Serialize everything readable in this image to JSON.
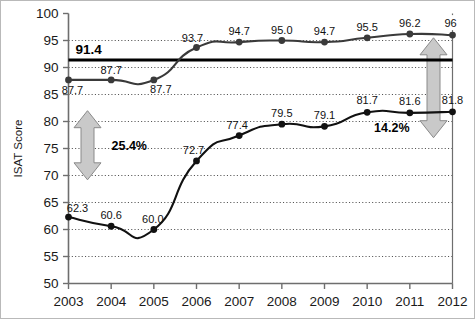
{
  "chart_data": {
    "type": "line",
    "title": "",
    "subtitle": "",
    "xlabel": "",
    "ylabel": "ISAT Score",
    "categories": [
      "2003",
      "2004",
      "2005",
      "2006",
      "2007",
      "2008",
      "2009",
      "2010",
      "2011",
      "2012"
    ],
    "x": [
      2003,
      2004,
      2005,
      2006,
      2007,
      2008,
      2009,
      2010,
      2011,
      2012
    ],
    "xlim": [
      2003,
      2012
    ],
    "ylim": [
      50,
      100
    ],
    "y_ticks": [
      50,
      55,
      60,
      65,
      70,
      75,
      80,
      85,
      90,
      95,
      100
    ],
    "grid": "horizontal-dotted",
    "legend": "none",
    "series": [
      {
        "name": "upper-series",
        "values": [
          87.7,
          87.7,
          87.7,
          93.7,
          94.7,
          95.0,
          94.7,
          95.5,
          96.2,
          96
        ],
        "labels": [
          "87.7",
          "87.7",
          "87.7",
          "93.7",
          "94.7",
          "95.0",
          "94.7",
          "95.5",
          "96.2",
          "96"
        ],
        "color": "#3a3a3a",
        "marker": "circle"
      },
      {
        "name": "lower-series",
        "values": [
          62.3,
          60.6,
          60.0,
          72.7,
          77.4,
          79.5,
          79.1,
          81.7,
          81.6,
          81.8
        ],
        "labels": [
          "62.3",
          "60.6",
          "60.0",
          "72.7",
          "77.4",
          "79.5",
          "79.1",
          "81.7",
          "81.6",
          "81.8"
        ],
        "color": "#111111",
        "marker": "circle"
      }
    ],
    "reference_line": {
      "name": "reference-line-91-4",
      "value": 91.4,
      "label": "91.4",
      "color": "#000000"
    },
    "annotations": [
      {
        "name": "gap-arrow-left",
        "label": "25.4%",
        "kind": "double-arrow-vertical",
        "from": 69.2,
        "to": 82.0,
        "at_x": 2003,
        "color": "#b5b5b5"
      },
      {
        "name": "gap-arrow-right",
        "label": "14.2%",
        "kind": "double-arrow-vertical",
        "from": 77.0,
        "to": 95.5,
        "at_x": 2012,
        "color": "#b5b5b5"
      }
    ]
  },
  "axes": {
    "y_tick_labels": [
      "100",
      "95",
      "90",
      "85",
      "80",
      "75",
      "70",
      "65",
      "60",
      "55",
      "50"
    ],
    "x_tick_labels": [
      "2003",
      "2004",
      "2005",
      "2006",
      "2007",
      "2008",
      "2009",
      "2010",
      "2011",
      "2012"
    ],
    "y_axis_title": "ISAT Score"
  }
}
